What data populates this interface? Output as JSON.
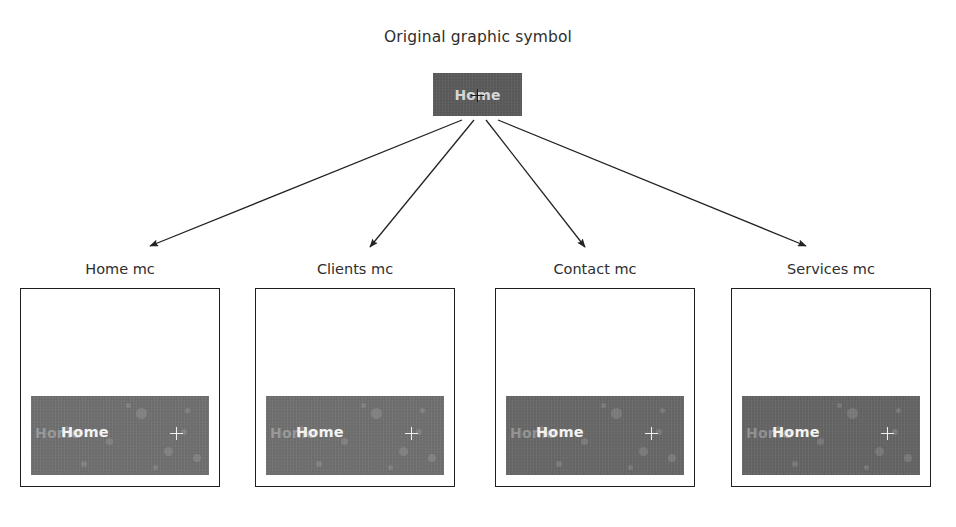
{
  "diagram": {
    "title": "Original graphic symbol",
    "arrow_color": "#232323",
    "background_color": "#ffffff"
  },
  "source_symbol": {
    "name": "source-graphic-symbol",
    "label": "Home",
    "box_color": "#5b5b5b",
    "label_color": "#d6d6d6",
    "registration_icon": "crosshair-icon",
    "x": 433,
    "y": 73,
    "width": 89,
    "height": 43
  },
  "arrows": [
    {
      "name": "arrow-to-home-mc",
      "from_x": 462,
      "from_y": 120,
      "to_x": 150,
      "to_y": 246
    },
    {
      "name": "arrow-to-clients-mc",
      "from_x": 474,
      "from_y": 120,
      "to_x": 370,
      "to_y": 247
    },
    {
      "name": "arrow-to-contact-mc",
      "from_x": 486,
      "from_y": 120,
      "to_x": 585,
      "to_y": 247
    },
    {
      "name": "arrow-to-services-mc",
      "from_x": 498,
      "from_y": 120,
      "to_x": 806,
      "to_y": 246
    }
  ],
  "instances": [
    {
      "key": "home-mc",
      "label": "Home mc",
      "x": 20,
      "band_label": "Home",
      "band_ghost_label": "Home",
      "band_color": "#6f6f6f",
      "band_label_color": "#f2f2f2",
      "registration_icon": "crosshair-icon"
    },
    {
      "key": "clients-mc",
      "label": "Clients mc",
      "x": 255,
      "band_label": "Home",
      "band_ghost_label": "Home",
      "band_color": "#6f6f6f",
      "band_label_color": "#f2f2f2",
      "registration_icon": "crosshair-icon"
    },
    {
      "key": "contact-mc",
      "label": "Contact mc",
      "x": 495,
      "band_label": "Home",
      "band_ghost_label": "Home",
      "band_color": "#676767",
      "band_label_color": "#f2f2f2",
      "registration_icon": "crosshair-icon"
    },
    {
      "key": "services-mc",
      "label": "Services mc",
      "x": 731,
      "band_label": "Home",
      "band_ghost_label": "Home",
      "band_color": "#646464",
      "band_label_color": "#f2f2f2",
      "registration_icon": "crosshair-icon"
    }
  ]
}
